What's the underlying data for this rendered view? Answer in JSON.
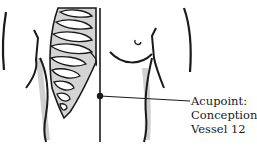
{
  "diagram": {
    "acupoint": {
      "label_lines": [
        "Acupoint:",
        "Conception",
        "Vessel 12"
      ],
      "marker_color": "#1a1a1a"
    },
    "colors": {
      "line": "#1a1a1a",
      "shading": "#c8c8c8",
      "background": "#ffffff"
    }
  }
}
